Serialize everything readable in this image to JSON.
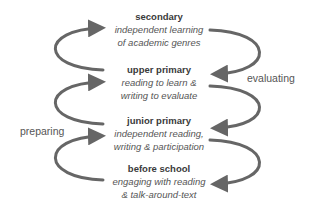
{
  "diagram": {
    "stages": [
      {
        "title": "secondary",
        "desc": [
          "independent learning",
          "of academic genres"
        ]
      },
      {
        "title": "upper primary",
        "desc": [
          "reading to learn &",
          "writing to evaluate"
        ]
      },
      {
        "title": "junior primary",
        "desc": [
          "independent reading,",
          "writing & participation"
        ]
      },
      {
        "title": "before school",
        "desc": [
          "engaging with reading",
          "& talk-around-text"
        ]
      }
    ],
    "labels": {
      "left": "preparing",
      "right": "evaluating"
    },
    "colors": {
      "arrow": "#666666",
      "title": "#3a3a3a",
      "text": "#555555"
    }
  }
}
